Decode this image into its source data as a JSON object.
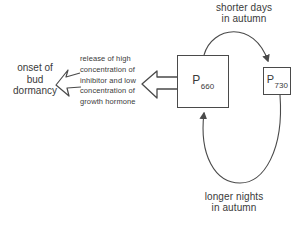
{
  "diagram": {
    "top_label": "shorter days\nin autumn",
    "bottom_label": "longer nights\nin autumn",
    "outcome_label": "onset of\nbud\ndormancy",
    "release_label": "release of high\nconcentration of\ninhibitor and low\nconcentration of\ngrowth hormone",
    "p660": {
      "base": "P",
      "sub": "660"
    },
    "p730": {
      "base": "P",
      "sub": "730"
    },
    "colors": {
      "ink": "#3a3a3a",
      "line": "#4a4a4a",
      "background": "#ffffff"
    }
  }
}
